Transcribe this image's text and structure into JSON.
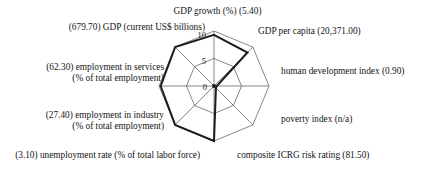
{
  "chart_data": {
    "type": "radar",
    "title": "",
    "grid": true,
    "legend": null,
    "rlim": [
      0,
      10
    ],
    "radial_ticks": [
      0,
      5,
      10
    ],
    "radial_tick_labels": [
      "0",
      "5",
      "10"
    ],
    "categories": [
      "GDP growth (%) (5.40)",
      "GDP per capita (20,371.00)",
      "human development index (0.90)",
      "poverty index (n/a)",
      "composite ICRG risk rating (81.50)",
      "(3.10) unemployment rate (% of total labor force)",
      "(27.40) employment in industry\n(% of total employment)",
      "(62.30) employment in services\n(% of total employment)",
      "(679.70) GDP (current US$ billions)"
    ],
    "series": [
      {
        "name": "country profile",
        "values": [
          9.3,
          8.6,
          0.5,
          0.5,
          10.0,
          10.0,
          9.7,
          10.0,
          10.0
        ]
      }
    ],
    "raw_values": [
      {
        "indicator": "GDP growth (%)",
        "value": "5.40"
      },
      {
        "indicator": "GDP per capita",
        "value": "20,371.00"
      },
      {
        "indicator": "human development index",
        "value": "0.90"
      },
      {
        "indicator": "poverty index",
        "value": "n/a"
      },
      {
        "indicator": "composite ICRG risk rating",
        "value": "81.50"
      },
      {
        "indicator": "unemployment rate (% of total labor force)",
        "value": "3.10"
      },
      {
        "indicator": "employment in industry (% of total employment)",
        "value": "27.40"
      },
      {
        "indicator": "employment in services (% of total employment)",
        "value": "62.30"
      },
      {
        "indicator": "GDP (current US$ billions)",
        "value": "679.70"
      }
    ]
  },
  "axis_labels": {
    "top": "GDP growth (%) (5.40)",
    "top_right": "GDP per capita (20,371.00)",
    "right": "human development index (0.90)",
    "bottom_right": "poverty index (n/a)",
    "bottom_right2": "composite ICRG risk rating (81.50)",
    "bottom_left": "(3.10) unemployment rate (% of total labor force)",
    "left_lower_line1": "(27.40) employment in industry",
    "left_lower_line2": "(% of total employment)",
    "left_upper_line1": "(62.30) employment in services",
    "left_upper_line2": "(% of total employment)",
    "top_left": "(679.70) GDP (current US$ billions)"
  },
  "ticks": {
    "outer": "10",
    "middle": "5",
    "center": "0"
  },
  "colors": {
    "data_line": "#1d1d1d",
    "grid": "#555555",
    "background": "#ffffff",
    "text": "#141414"
  }
}
